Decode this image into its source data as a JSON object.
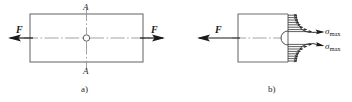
{
  "figure": {
    "colors": {
      "outline": "#6f6f6f",
      "centerline": "#8a8a8a",
      "arrow": "#1a1a1a",
      "stress": "#2a2a2a",
      "text": "#1a1a1a"
    },
    "panels": [
      {
        "id": "a",
        "caption": "a)",
        "description": "Rectangular plate with central hole loaded by equal and opposite axial forces F; section line A-A passes vertically through the hole centre.",
        "force_label_left": "F",
        "force_label_right": "F",
        "section_label_top": "A",
        "section_label_bottom": "A",
        "plate": {
          "x": 30,
          "y": 14,
          "width": 113,
          "height": 48
        },
        "hole": {
          "cx": 86.5,
          "cy": 38,
          "r": 3.2
        },
        "section_line_x": 86.5
      },
      {
        "id": "b",
        "caption": "b)",
        "description": "Half-plate free body at section A-A showing the non-uniform normal stress distribution, peaking at sigma max adjacent to the hole boundary.",
        "force_label_left": "F",
        "stress_label_upper": "σmax",
        "stress_label_lower": "σmax",
        "stress_symbol": "σ",
        "stress_subscript": "max",
        "plate": {
          "x": 238,
          "y": 14,
          "width": 50,
          "height": 48
        },
        "hole_arc": {
          "cx": 288,
          "cy": 38,
          "r": 7
        },
        "distribution": {
          "note": "normal stress sigma varies across the section, maximum at the hole edge and decaying to a nominal value at the free edges",
          "arrow_rows": 16
        }
      }
    ]
  }
}
